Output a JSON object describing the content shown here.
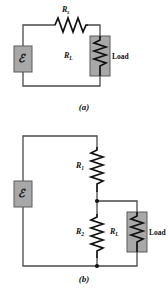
{
  "figure": {
    "colors": {
      "wire": "#4a4a4a",
      "box_fill": "#a8a8a8",
      "box_stroke": "#5a5a5a",
      "resistor": "#111111",
      "text": "#111111",
      "background": "#ffffff"
    },
    "panels": [
      {
        "id": "a",
        "caption": "(a)",
        "description": "Series circuit: emf source with series resistance Rs driving load RL",
        "components": [
          {
            "name": "emf-source",
            "label": "ℰ",
            "type": "source"
          },
          {
            "name": "series-resistor",
            "label": "R",
            "sub": "s",
            "type": "resistor",
            "orientation": "horizontal"
          },
          {
            "name": "load-resistor",
            "label": "R",
            "sub": "L",
            "type": "resistor",
            "orientation": "vertical"
          },
          {
            "name": "load-annotation",
            "label": "Load",
            "type": "text"
          }
        ]
      },
      {
        "id": "b",
        "caption": "(b)",
        "description": "Voltage divider: emf source with R1 in series, R2 in parallel with load RL",
        "components": [
          {
            "name": "emf-source",
            "label": "ℰ",
            "type": "source"
          },
          {
            "name": "divider-resistor-top",
            "label": "R",
            "sub": "1",
            "type": "resistor",
            "orientation": "vertical"
          },
          {
            "name": "divider-resistor-bottom",
            "label": "R",
            "sub": "2",
            "type": "resistor",
            "orientation": "vertical"
          },
          {
            "name": "load-resistor",
            "label": "R",
            "sub": "L",
            "type": "resistor",
            "orientation": "vertical"
          },
          {
            "name": "load-annotation",
            "label": "Load",
            "type": "text"
          }
        ],
        "junctions": 2
      }
    ]
  }
}
